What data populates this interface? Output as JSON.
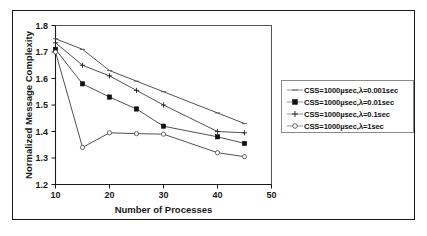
{
  "figure": {
    "background_color": "#ffffff",
    "frame_color": "#1a1a1a"
  },
  "chart_data": {
    "type": "line",
    "title": "",
    "xlabel": "Number of Processes",
    "ylabel": "Normalized Message Complexity",
    "x": [
      10,
      15,
      20,
      25,
      30,
      40,
      45
    ],
    "xlim": [
      10,
      50
    ],
    "ylim": [
      1.2,
      1.8
    ],
    "xticks": [
      10,
      20,
      30,
      40,
      50
    ],
    "yticks": [
      1.2,
      1.3,
      1.4,
      1.5,
      1.6,
      1.7,
      1.8
    ],
    "xtick_labels": [
      "10",
      "20",
      "30",
      "40",
      "50"
    ],
    "ytick_labels": [
      "1.2",
      "1.3",
      "1.4",
      "1.5",
      "1.6",
      "1.7",
      "1.8"
    ],
    "grid": false,
    "legend_position": "right-outside",
    "series": [
      {
        "name": "CSS=1000µsec,λ=0.001sec",
        "marker": "dash",
        "values": [
          1.75,
          1.71,
          1.63,
          1.59,
          1.55,
          1.47,
          1.43
        ]
      },
      {
        "name": "CSS=1000µsec,λ=0.01sec",
        "marker": "filled-square",
        "values": [
          1.71,
          1.58,
          1.53,
          1.485,
          1.42,
          1.38,
          1.355
        ]
      },
      {
        "name": "CSS=1000µsec,λ=0.1sec",
        "marker": "plus",
        "values": [
          1.735,
          1.65,
          1.61,
          1.555,
          1.5,
          1.4,
          1.395
        ]
      },
      {
        "name": "CSS=1000µsec,λ=1sec",
        "marker": "hollow-circle",
        "values": [
          1.7,
          1.34,
          1.395,
          1.392,
          1.39,
          1.32,
          1.305
        ]
      }
    ]
  },
  "legend": {
    "entries": [
      {
        "label": "CSS=1000µsec,λ=0.001sec"
      },
      {
        "label": "CSS=1000µsec,λ=0.01sec"
      },
      {
        "label": "CSS=1000µsec,λ=0.1sec"
      },
      {
        "label": "CSS=1000µsec,λ=1sec"
      }
    ]
  }
}
